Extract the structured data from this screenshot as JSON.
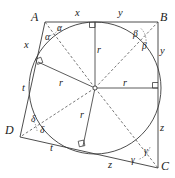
{
  "figure": {
    "type": "geometry-diagram",
    "background_color": "#ffffff",
    "stroke_color": "#3a3a3a",
    "dashed_stroke_color": "#4a4a4a"
  },
  "vertices": [
    {
      "name": "A",
      "label": "A",
      "x": 45,
      "y": 22
    },
    {
      "name": "B",
      "label": "B",
      "x": 158,
      "y": 22
    },
    {
      "name": "C",
      "label": "C",
      "x": 158,
      "y": 168
    },
    {
      "name": "D",
      "label": "D",
      "x": 20,
      "y": 137
    }
  ],
  "circle": {
    "center_x": 95,
    "center_y": 88,
    "radius": 66
  },
  "tangent_points": [
    {
      "name": "top-tangent-point",
      "x": 95,
      "y": 22
    },
    {
      "name": "right-tangent-point",
      "x": 150,
      "y": 88
    },
    {
      "name": "bottom-tangent-point",
      "x": 83,
      "y": 144
    },
    {
      "name": "left-tangent-point",
      "x": 40,
      "y": 63
    }
  ],
  "segment_labels": [
    {
      "name": "segment-label-x-top",
      "text": "x",
      "x": 75,
      "y": 8
    },
    {
      "name": "segment-label-y-top",
      "text": "y",
      "x": 118,
      "y": 8
    },
    {
      "name": "segment-label-x-left",
      "text": "x",
      "x": 24,
      "y": 40
    },
    {
      "name": "segment-label-y-right",
      "text": "y",
      "x": 160,
      "y": 46
    },
    {
      "name": "segment-label-t-left",
      "text": "t",
      "x": 22,
      "y": 83
    },
    {
      "name": "segment-label-z-right",
      "text": "z",
      "x": 160,
      "y": 123
    },
    {
      "name": "segment-label-t-bottom",
      "text": "t",
      "x": 50,
      "y": 143
    },
    {
      "name": "segment-label-z-bottom",
      "text": "z",
      "x": 108,
      "y": 160
    }
  ],
  "radius_labels": [
    {
      "name": "radius-label-top",
      "text": "r",
      "x": 97,
      "y": 45
    },
    {
      "name": "radius-label-left",
      "text": "r",
      "x": 59,
      "y": 78
    },
    {
      "name": "radius-label-right",
      "text": "r",
      "x": 123,
      "y": 78
    },
    {
      "name": "radius-label-bottom",
      "text": "r",
      "x": 80,
      "y": 110
    }
  ],
  "angle_labels": [
    {
      "name": "angle-label-alpha-upper",
      "text": "α",
      "x": 57,
      "y": 24
    },
    {
      "name": "angle-label-alpha-lower",
      "text": "α",
      "x": 45,
      "y": 33
    },
    {
      "name": "angle-label-beta-upper",
      "text": "β",
      "x": 133,
      "y": 30
    },
    {
      "name": "angle-label-beta-lower",
      "text": "β",
      "x": 142,
      "y": 42
    },
    {
      "name": "angle-label-gamma-upper",
      "text": "γ",
      "x": 144,
      "y": 147
    },
    {
      "name": "angle-label-gamma-lower",
      "text": "γ",
      "x": 131,
      "y": 156
    },
    {
      "name": "angle-label-delta-upper",
      "text": "δ",
      "x": 31,
      "y": 115
    },
    {
      "name": "angle-label-delta-lower",
      "text": "δ",
      "x": 40,
      "y": 126
    }
  ],
  "vertex_label_positions": [
    {
      "name": "vertex-label-A",
      "text": "A",
      "x": 31,
      "y": 11
    },
    {
      "name": "vertex-label-B",
      "text": "B",
      "x": 160,
      "y": 11
    },
    {
      "name": "vertex-label-C",
      "text": "C",
      "x": 161,
      "y": 160
    },
    {
      "name": "vertex-label-D",
      "text": "D",
      "x": 5,
      "y": 124
    }
  ]
}
